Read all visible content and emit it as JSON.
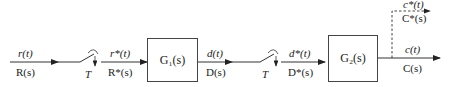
{
  "diagram": {
    "type": "sampled-data block diagram",
    "signals": {
      "input": {
        "time": "r(t)",
        "laplace": "R(s)"
      },
      "sampled_input": {
        "time": "r*(t)",
        "laplace": "R*(s)"
      },
      "intermediate": {
        "time": "d(t)",
        "laplace": "D(s)"
      },
      "sampled_intermediate": {
        "time": "d*(t)",
        "laplace": "D*(s)"
      },
      "output": {
        "time": "c(t)",
        "laplace": "C(s)"
      },
      "sampled_output": {
        "time": "c*(t)",
        "laplace": "C*(s)"
      }
    },
    "samplers": [
      {
        "label": "T"
      },
      {
        "label": "T"
      }
    ],
    "blocks": [
      {
        "label": "G₁(s)"
      },
      {
        "label": "G₂(s)"
      }
    ]
  }
}
